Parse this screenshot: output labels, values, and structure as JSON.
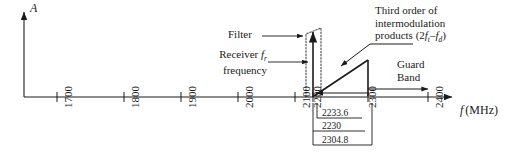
{
  "figure": {
    "type": "frequency-spectrum-diagram",
    "y_axis_label": "A",
    "x_axis_label_italic": "f",
    "x_axis_label_unit": "(MHz)"
  },
  "axis": {
    "ticks": [
      {
        "label": "1700",
        "x": 57
      },
      {
        "label": "1800",
        "x": 124
      },
      {
        "label": "1900",
        "x": 181
      },
      {
        "label": "2000",
        "x": 238
      },
      {
        "label": "2100",
        "x": 295
      },
      {
        "label": "2200",
        "x": 313
      },
      {
        "label": "2300",
        "x": 368
      },
      {
        "label": "2400",
        "x": 428
      }
    ]
  },
  "callouts": {
    "filter": "Filter",
    "receiver_line1_pre": "Receiver ",
    "receiver_line1_var": "f",
    "receiver_line1_sub": "r",
    "receiver_line2": "frequency",
    "third_order_line1": "Third order of",
    "third_order_line2": "intermodulation",
    "third_order_line3_pre": "products (2",
    "third_order_var1": "f",
    "third_order_sub1": "t",
    "third_order_mid": "–",
    "third_order_var2": "f",
    "third_order_sub2": "d",
    "third_order_line3_post": ")",
    "guard_line1": "Guard",
    "guard_line2": "Band"
  },
  "dimensions": {
    "upper": "2233.6",
    "middle": "2230",
    "lower": "2304.8"
  },
  "colors": {
    "stroke": "#1a1a1a",
    "dotted": "#555555",
    "background": "#ffffff"
  }
}
